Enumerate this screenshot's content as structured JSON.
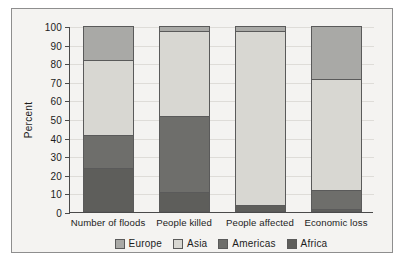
{
  "chart_data": {
    "type": "bar",
    "subtype": "stacked-bar-100",
    "title": "",
    "xlabel": "",
    "ylabel": "Percent",
    "ylim": [
      0,
      100
    ],
    "ytick_step": 10,
    "grid": true,
    "legend_position": "bottom",
    "categories": [
      "Number of floods",
      "People killed",
      "People affected",
      "Economic loss"
    ],
    "ytick_labels": [
      "0",
      "10",
      "20",
      "30",
      "40",
      "50",
      "60",
      "70",
      "80",
      "90",
      "100"
    ],
    "series": [
      {
        "name": "Europe",
        "color": "#a9a9a6",
        "values": [
          18,
          2,
          2,
          28
        ]
      },
      {
        "name": "Asia",
        "color": "#d8d7d2",
        "values": [
          40,
          46,
          93.5,
          59.5
        ]
      },
      {
        "name": "Americas",
        "color": "#6e6e6b",
        "values": [
          18,
          40.5,
          0,
          10.5
        ]
      },
      {
        "name": "Africa",
        "color": "#5e5e5b",
        "values": [
          24,
          11.5,
          4.5,
          2
        ]
      }
    ],
    "stack_order_top_to_bottom": [
      "Europe",
      "Asia",
      "Americas",
      "Africa"
    ],
    "cumulative_boundaries": {
      "Number of floods": {
        "africa_top": 24,
        "americas_top": 42,
        "asia_top": 82,
        "europe_top": 100
      },
      "People killed": {
        "africa_top": 11.5,
        "americas_top": 52,
        "asia_top": 98,
        "europe_top": 100
      },
      "People affected": {
        "africa_top": 4.5,
        "americas_top": 4.5,
        "asia_top": 98,
        "europe_top": 100
      },
      "Economic loss": {
        "africa_top": 2,
        "americas_top": 12.5,
        "asia_top": 72,
        "europe_top": 100
      }
    }
  },
  "legend": {
    "items": [
      {
        "label": "Europe"
      },
      {
        "label": "Asia"
      },
      {
        "label": "Americas"
      },
      {
        "label": "Africa"
      }
    ]
  },
  "colors": {
    "europe": "#a9a9a6",
    "asia": "#d8d7d2",
    "americas": "#6e6e6b",
    "africa": "#5e5e5b",
    "axis": "#4a4a4a",
    "grid": "#dedcd8",
    "background": "#f4f3f1",
    "frame": "#8e8e8e",
    "text": "#1c1c1c"
  }
}
